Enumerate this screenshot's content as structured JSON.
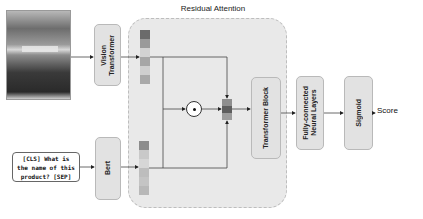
{
  "title": "Residual Attention",
  "input_image": {
    "alt": "product photo"
  },
  "input_text": "[CLS] What is\nthe name of this\nproduct? [SEP]",
  "blocks": {
    "vision_transformer": "Vision\nTransformer",
    "bert": "Bert",
    "transformer_block": "Transformer Block",
    "fully_connected": "Fully-connected\nNeural Layers",
    "sigmoid": "Sigmoid"
  },
  "operator": "element-wise product",
  "output_label": "Score",
  "colors": {
    "residual_bg": "#e9e9e9",
    "block_bg": "#e2e2e2",
    "vision_stack": [
      "#6b6b6b",
      "#9a9a9a",
      "#d2d2d2",
      "#a6a6a6",
      "#cfcfcf",
      "#a9a9a9"
    ],
    "text_stack": [
      "#8c8c8c",
      "#c9c9c9",
      "#d6d6d6",
      "#bdbdbd",
      "#c4c4c4",
      "#b8b8b8"
    ],
    "fused_stack": [
      "#8e8e8e",
      "#5e5e5e",
      "#9c9c9c"
    ]
  }
}
